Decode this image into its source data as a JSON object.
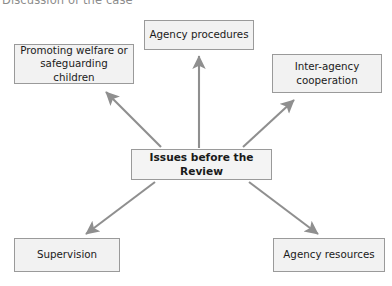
{
  "title": "Discussion of the case",
  "colors": {
    "node_fill": "#f2f2f2",
    "node_border": "#9a9a9a",
    "arrow": "#8f8f8f",
    "title_text": "#8c8c8c",
    "node_text": "#1a1a1a",
    "background": "#ffffff"
  },
  "diagram": {
    "type": "hub-and-spoke",
    "center": {
      "label": "Issues before the Review",
      "bold": true
    },
    "nodes": [
      {
        "id": "procedures",
        "label": "Agency procedures",
        "position": "top-center"
      },
      {
        "id": "welfare",
        "label": "Promoting welfare or\nsafeguarding children",
        "position": "top-left"
      },
      {
        "id": "interagency",
        "label": "Inter-agency\ncooperation",
        "position": "top-right"
      },
      {
        "id": "supervision",
        "label": "Supervision",
        "position": "bottom-left"
      },
      {
        "id": "resources",
        "label": "Agency resources",
        "position": "bottom-right"
      }
    ],
    "arrows": [
      {
        "from": "center",
        "to": "procedures",
        "direction": "up"
      },
      {
        "from": "center",
        "to": "welfare",
        "direction": "up-left"
      },
      {
        "from": "center",
        "to": "interagency",
        "direction": "up-right"
      },
      {
        "from": "center",
        "to": "supervision",
        "direction": "down-left"
      },
      {
        "from": "center",
        "to": "resources",
        "direction": "down-right"
      }
    ]
  }
}
